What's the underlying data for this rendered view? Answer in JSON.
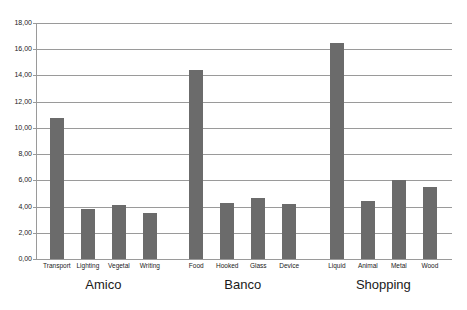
{
  "chart_data": {
    "type": "bar",
    "title": "",
    "xlabel": "",
    "ylabel": "",
    "ylim": [
      0,
      18
    ],
    "ytick_values": [
      0,
      2,
      4,
      6,
      8,
      10,
      12,
      14,
      16,
      18
    ],
    "ytick_labels": [
      "0,00",
      "2,00",
      "4,00",
      "6,00",
      "8,00",
      "10,00",
      "12,00",
      "14,00",
      "16,00",
      "18,00"
    ],
    "grid": true,
    "legend": "none",
    "bar_color": "#6b6b6b",
    "grid_color": "#9a9a9a",
    "groups": [
      {
        "name": "Amico",
        "categories": [
          "Transport",
          "Lighting",
          "Vegetal",
          "Writing"
        ],
        "values": [
          10.75,
          3.8,
          4.1,
          3.5
        ]
      },
      {
        "name": "Banco",
        "categories": [
          "Food",
          "Hooked",
          "Glass",
          "Device"
        ],
        "values": [
          14.4,
          4.3,
          4.65,
          4.2
        ]
      },
      {
        "name": "Shopping",
        "categories": [
          "Liquid",
          "Animal",
          "Metal",
          "Wood"
        ],
        "values": [
          16.5,
          4.4,
          6.0,
          5.5
        ]
      }
    ]
  }
}
